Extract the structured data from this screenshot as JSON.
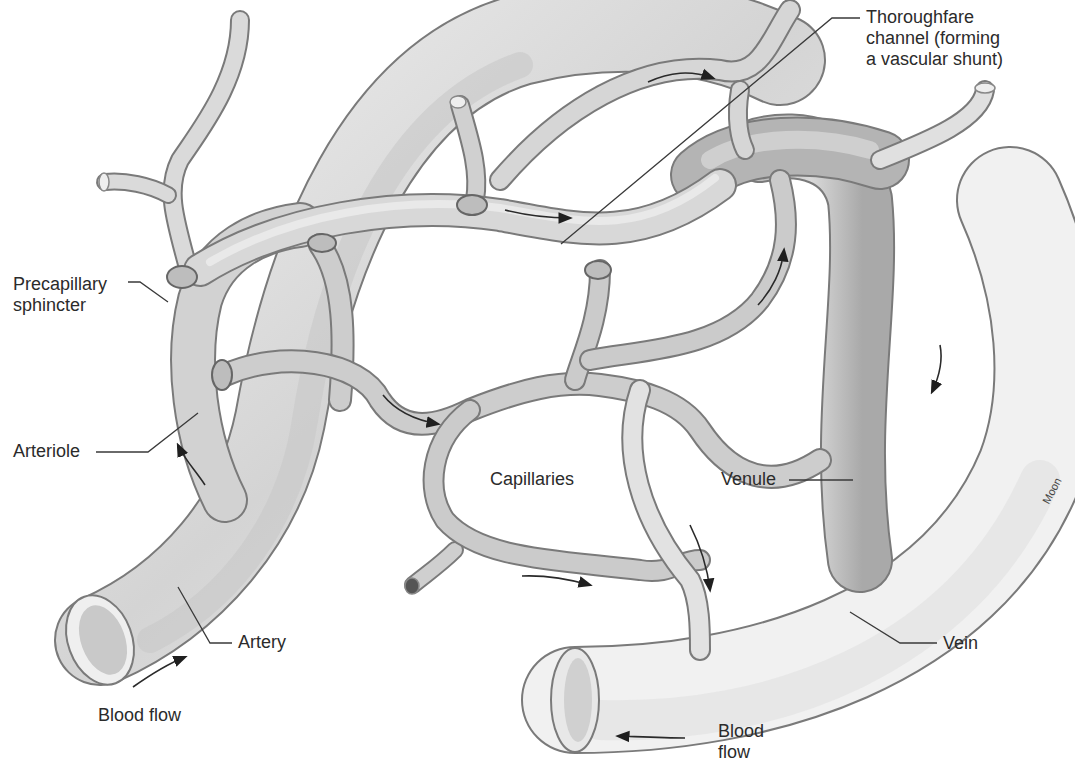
{
  "figure": {
    "colors": {
      "background": "#ffffff",
      "vessel_light": "#e6e6e6",
      "vessel_mid": "#c4c4c4",
      "vessel_dark": "#9a9a9a",
      "outline": "#7a7a7a",
      "text": "#2b2b2b"
    }
  },
  "labels": {
    "thoroughfare_line1": "Thoroughfare",
    "thoroughfare_line2": "channel (forming",
    "thoroughfare_line3": "a vascular shunt)",
    "precapillary_line1": "Precapillary",
    "precapillary_line2": "sphincter",
    "arteriole": "Arteriole",
    "capillaries": "Capillaries",
    "venule": "Venule",
    "artery": "Artery",
    "vein": "Vein",
    "blood_flow_left": "Blood flow",
    "blood_flow_right_line1": "Blood",
    "blood_flow_right_line2": "flow",
    "credit": "Moon"
  },
  "flow_arrows": [
    {
      "location": "below artery opening",
      "direction": "up-right"
    },
    {
      "location": "arteriole",
      "direction": "up"
    },
    {
      "location": "thoroughfare channel mid",
      "direction": "right"
    },
    {
      "location": "top capillary loop",
      "direction": "right"
    },
    {
      "location": "capillary mid",
      "direction": "right"
    },
    {
      "location": "lower capillary",
      "direction": "right"
    },
    {
      "location": "right capillary ascending",
      "direction": "up"
    },
    {
      "location": "venule descending",
      "direction": "down"
    },
    {
      "location": "vein right side",
      "direction": "down"
    },
    {
      "location": "below vein",
      "direction": "left"
    }
  ]
}
